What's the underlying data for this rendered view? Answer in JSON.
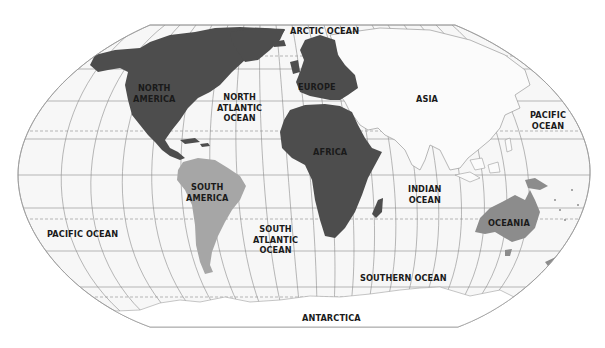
{
  "map": {
    "projection": "robinson-like world map",
    "colors": {
      "background": "#ffffff",
      "ocean": "#f7f7f7",
      "graticule": "#8a8a8a",
      "north_america": "#4d4d4d",
      "europe": "#4d4d4d",
      "africa": "#4d4d4d",
      "south_america": "#a6a6a6",
      "oceania": "#8c8c8c",
      "asia": "#fbfbfb",
      "antarctica": "#ffffff",
      "label_text": "#1a1a1a"
    },
    "continents": [
      {
        "id": "north-america",
        "lines": [
          "NORTH",
          "AMERICA"
        ]
      },
      {
        "id": "south-america",
        "lines": [
          "SOUTH",
          "AMERICA"
        ]
      },
      {
        "id": "europe",
        "lines": [
          "EUROPE"
        ]
      },
      {
        "id": "africa",
        "lines": [
          "AFRICA"
        ]
      },
      {
        "id": "asia",
        "lines": [
          "ASIA"
        ]
      },
      {
        "id": "oceania",
        "lines": [
          "OCEANIA"
        ]
      },
      {
        "id": "antarctica",
        "lines": [
          "ANTARCTICA"
        ]
      }
    ],
    "oceans": [
      {
        "id": "arctic-ocean",
        "lines": [
          "ARCTIC OCEAN"
        ]
      },
      {
        "id": "north-atlantic-ocean",
        "lines": [
          "NORTH",
          "ATLANTIC",
          "OCEAN"
        ]
      },
      {
        "id": "south-atlantic-ocean",
        "lines": [
          "SOUTH",
          "ATLANTIC",
          "OCEAN"
        ]
      },
      {
        "id": "pacific-ocean-east",
        "lines": [
          "PACIFIC",
          "OCEAN"
        ]
      },
      {
        "id": "pacific-ocean-west",
        "lines": [
          "PACIFIC OCEAN"
        ]
      },
      {
        "id": "indian-ocean",
        "lines": [
          "INDIAN",
          "OCEAN"
        ]
      },
      {
        "id": "southern-ocean",
        "lines": [
          "SOUTHERN OCEAN"
        ]
      }
    ]
  }
}
